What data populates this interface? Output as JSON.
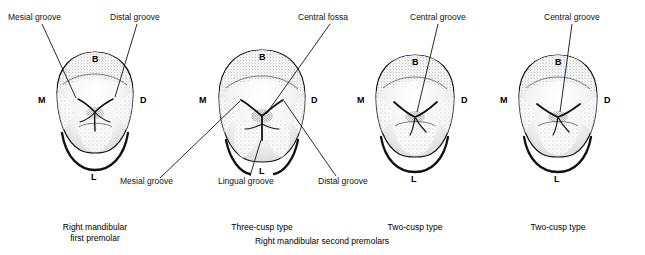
{
  "figure": {
    "title": "",
    "teeth": [
      {
        "id": "tooth-1",
        "caption": [
          "Right mandibular",
          "first premolar"
        ],
        "surface_marks": {
          "buccal": "B",
          "mesial": "M",
          "distal": "D",
          "lingual": "L"
        },
        "annotations": [
          {
            "name": "mesial-groove",
            "text": "Mesial groove"
          },
          {
            "name": "distal-groove",
            "text": "Distal groove"
          }
        ]
      },
      {
        "id": "tooth-2",
        "caption": [
          "Three-cusp type"
        ],
        "surface_marks": {
          "buccal": "B",
          "mesial": "M",
          "distal": "D",
          "lingual": "L"
        },
        "annotations": [
          {
            "name": "central-fossa",
            "text": "Central fossa"
          },
          {
            "name": "mesial-groove",
            "text": "Mesial groove"
          },
          {
            "name": "lingual-groove",
            "text": "Lingual groove"
          },
          {
            "name": "distal-groove",
            "text": "Distal groove"
          }
        ]
      },
      {
        "id": "tooth-3",
        "caption": [
          "Two-cusp type"
        ],
        "surface_marks": {
          "buccal": "B",
          "mesial": "M",
          "distal": "D",
          "lingual": "L"
        },
        "annotations": [
          {
            "name": "central-groove",
            "text": "Central groove"
          }
        ]
      },
      {
        "id": "tooth-4",
        "caption": [
          "Two-cusp type"
        ],
        "surface_marks": {
          "buccal": "B",
          "mesial": "M",
          "distal": "D",
          "lingual": "L"
        },
        "annotations": [
          {
            "name": "central-groove",
            "text": "Central groove"
          }
        ]
      }
    ],
    "group_caption": "Right mandibular second premolars",
    "colors": {
      "ink": "#000000",
      "background": "#ffffff",
      "stipple": "#3a3a3a",
      "shade": "#e8e8e8"
    }
  },
  "labels": {
    "mesial_groove_1": "Mesial groove",
    "distal_groove_1": "Distal groove",
    "central_fossa": "Central fossa",
    "central_groove_3": "Central groove",
    "central_groove_4": "Central groove",
    "mesial_groove_2": "Mesial groove",
    "lingual_groove_2": "Lingual groove",
    "distal_groove_2": "Distal groove",
    "b1": "B",
    "m1": "M",
    "d1": "D",
    "l1": "L",
    "b2": "B",
    "m2": "M",
    "d2": "D",
    "l2": "L",
    "b3": "B",
    "m3": "M",
    "d3": "D",
    "l3": "L",
    "b4": "B",
    "m4": "M",
    "d4": "D",
    "l4": "L",
    "cap1_line1": "Right mandibular",
    "cap1_line2": "first premolar",
    "cap2": "Three-cusp type",
    "cap3": "Two-cusp type",
    "cap4": "Two-cusp type",
    "cap_group": "Right mandibular second premolars"
  }
}
